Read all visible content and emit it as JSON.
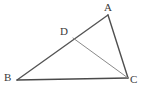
{
  "figure": {
    "name": "triangle-abc-with-cevian-dc",
    "width": 146,
    "height": 104,
    "background_color": "#ffffff"
  },
  "labels": {
    "a": "A",
    "b": "B",
    "c": "C",
    "d": "D"
  },
  "points": {
    "A": {
      "x": 108,
      "y": 15
    },
    "B": {
      "x": 17,
      "y": 80
    },
    "C": {
      "x": 128,
      "y": 78
    },
    "D": {
      "x": 73,
      "y": 38
    }
  },
  "segments": [
    {
      "name": "segment-ba",
      "from": "B",
      "to": "A",
      "color": "#555555",
      "width": 1.4
    },
    {
      "name": "segment-bc",
      "from": "B",
      "to": "C",
      "color": "#4a4a4a",
      "width": 1.3
    },
    {
      "name": "segment-ac",
      "from": "A",
      "to": "C",
      "color": "#4f4f4f",
      "width": 1.4
    },
    {
      "name": "segment-dc",
      "from": "D",
      "to": "C",
      "color": "#8a8a8a",
      "width": 1.0
    }
  ],
  "colors": {
    "stroke_dark": "#4a4a4a",
    "stroke_light": "#8a8a8a",
    "label_text": "#3a3a3a"
  }
}
